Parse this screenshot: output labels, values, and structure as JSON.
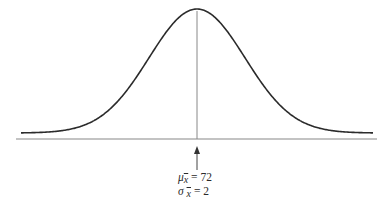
{
  "diagram": {
    "type": "normal-distribution-curve",
    "title": "",
    "curve": {
      "mean_x_px": 197,
      "peak_y_px": 11,
      "baseline_y_px": 133,
      "sigma_px": 48,
      "left_px": 21,
      "right_px": 373
    },
    "axis": {
      "y_px": 139,
      "x_start_px": 16,
      "x_end_px": 377,
      "color": "#888888"
    },
    "mean_line": {
      "x_px": 197,
      "color": "#888888"
    },
    "arrow": {
      "x_px": 197,
      "tip_y_px": 146,
      "tail_y_px": 170
    },
    "labels": {
      "mean": {
        "symbol": "μ",
        "subscript": "x̄",
        "equals": "= 72"
      },
      "sd": {
        "symbol": "σ",
        "subscript": "x̄",
        "equals": "= 2"
      }
    },
    "colors": {
      "curve": "#2b2b2b",
      "axis": "#888888",
      "text": "#2a2a2a"
    }
  },
  "chart_data": {
    "type": "line",
    "distribution": "normal",
    "mean": 72,
    "standard_deviation": 2,
    "annotations": [
      "μx̄ = 72",
      "σx̄ = 2"
    ],
    "xlabel": "",
    "ylabel": "",
    "grid": false
  }
}
